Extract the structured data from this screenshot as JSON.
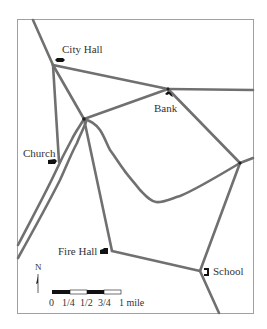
{
  "map": {
    "colors": {
      "road": "#6e6e6e",
      "frame": "#9a9a9a",
      "icon": "#111111",
      "text": "#333333"
    },
    "landmarks": [
      {
        "id": "city-hall",
        "label": "City Hall"
      },
      {
        "id": "bank",
        "label": "Bank"
      },
      {
        "id": "church",
        "label": "Church"
      },
      {
        "id": "fire-hall",
        "label": "Fire Hall"
      },
      {
        "id": "school",
        "label": "School"
      }
    ],
    "compass": {
      "label": "N"
    },
    "scale_bar": {
      "ticks": [
        "0",
        "1/4",
        "1/2",
        "3/4",
        "1 mile"
      ]
    }
  }
}
